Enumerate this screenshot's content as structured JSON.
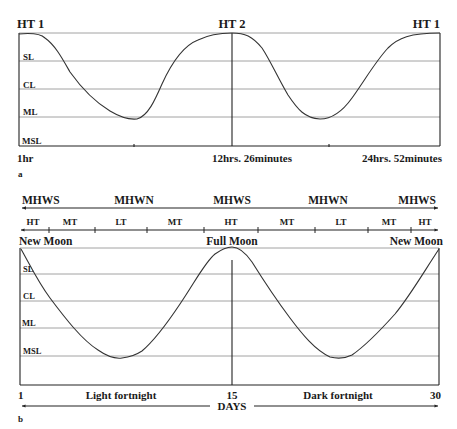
{
  "panel_a": {
    "tag": "a",
    "top_labels": [
      "HT 1",
      "HT 2",
      "HT 1"
    ],
    "level_labels": [
      "SL",
      "CL",
      "ML",
      "MSL"
    ],
    "time_labels": [
      "1hr",
      "12hrs. 26minutes",
      "24hrs. 52minutes"
    ]
  },
  "panel_b": {
    "tag": "b",
    "range_labels": [
      "MHWS",
      "MHWN",
      "MHWS",
      "MHWN",
      "MHWS"
    ],
    "tide_labels": [
      "HT",
      "MT",
      "LT",
      "MT",
      "HT",
      "MT",
      "LT",
      "MT",
      "HT"
    ],
    "moon_labels": [
      "New Moon",
      "Full Moon",
      "New Moon"
    ],
    "level_labels": [
      "SL",
      "CL",
      "ML",
      "MSL"
    ],
    "day_labels": [
      "1",
      "15",
      "30"
    ],
    "fortnight_labels": [
      "Light fortnight",
      "Dark fortnight"
    ],
    "axis_title": "DAYS"
  },
  "colors": {
    "line": "#333333",
    "grid": "#8a8a8a",
    "text": "#1a1a1a",
    "background": "#ffffff"
  }
}
